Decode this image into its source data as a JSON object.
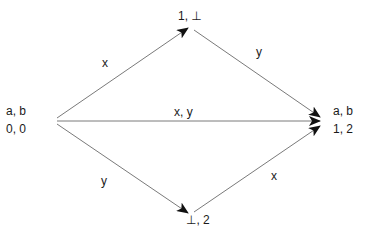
{
  "diagram": {
    "type": "state-transition",
    "nodes": {
      "start": {
        "line1": "a, b",
        "line2": "0, 0"
      },
      "top": {
        "line1": "1, ⊥"
      },
      "bottom": {
        "line1": "⊥, 2"
      },
      "end": {
        "line1": "a, b",
        "line2": "1, 2"
      }
    },
    "edges": {
      "start_to_top": {
        "label": "x"
      },
      "top_to_end": {
        "label": "y"
      },
      "start_to_end": {
        "label": "x, y"
      },
      "start_to_bottom": {
        "label": "y"
      },
      "bottom_to_end": {
        "label": "x"
      }
    },
    "colors": {
      "line": "#7a7a7a",
      "arrowhead": "#111111",
      "text": "#1a1a1a"
    }
  }
}
